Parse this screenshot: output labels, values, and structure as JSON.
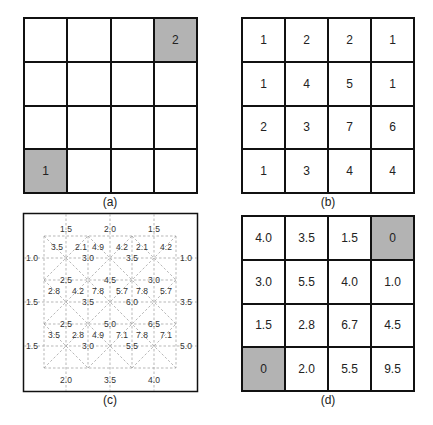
{
  "panels": {
    "a": {
      "caption": "(a)",
      "cells": [
        [
          "",
          "",
          "",
          "2"
        ],
        [
          "",
          "",
          "",
          ""
        ],
        [
          "",
          "",
          "",
          ""
        ],
        [
          "1",
          "",
          "",
          ""
        ]
      ],
      "shaded": [
        [
          0,
          3
        ],
        [
          3,
          0
        ]
      ]
    },
    "b": {
      "caption": "(b)",
      "cells": [
        [
          "1",
          "2",
          "2",
          "1"
        ],
        [
          "1",
          "4",
          "5",
          "1"
        ],
        [
          "2",
          "3",
          "7",
          "6"
        ],
        [
          "1",
          "3",
          "4",
          "4"
        ]
      ]
    },
    "c": {
      "caption": "(c)",
      "top_labels": [
        "1.5",
        "2.0",
        "1.5"
      ],
      "bottom_labels": [
        "2.0",
        "3.5",
        "4.0"
      ],
      "left_labels": [
        "1.0",
        "1.5",
        "1.5"
      ],
      "right_labels": [
        "1.0",
        "3.5",
        "5.0"
      ],
      "node_values": [
        [
          "3.0",
          "3.5"
        ],
        [
          "3.5",
          "6.0"
        ],
        [
          "3.0",
          "5.5"
        ]
      ],
      "mid_values": [
        [
          "2.5",
          "4.5",
          "3.0"
        ],
        [
          "2.5",
          "5.0",
          "6.5"
        ]
      ],
      "triangle_rows": [
        [
          "3.5",
          "2.1",
          "4.9",
          "4.2",
          "2.1",
          "4.2"
        ],
        [
          "2.8",
          "4.2",
          "7.8",
          "5.7",
          "7.8",
          "5.7"
        ],
        [
          "3.5",
          "2.8",
          "4.9",
          "7.1",
          "7.8",
          "7.1"
        ]
      ]
    },
    "d": {
      "caption": "(d)",
      "cells": [
        [
          "4.0",
          "3.5",
          "1.5",
          "0"
        ],
        [
          "3.0",
          "5.5",
          "4.0",
          "1.0"
        ],
        [
          "1.5",
          "2.8",
          "6.7",
          "4.5"
        ],
        [
          "0",
          "2.0",
          "5.5",
          "9.5"
        ]
      ],
      "shaded": [
        [
          0,
          3
        ],
        [
          3,
          0
        ]
      ]
    }
  },
  "colors": {
    "shaded": "#b3b3b3",
    "border": "#111111",
    "dashed": "#999999"
  }
}
